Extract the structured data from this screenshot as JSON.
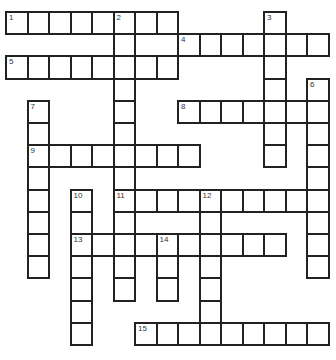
{
  "puzzle": {
    "type": "crossword",
    "origin": {
      "x": 6,
      "y": 12
    },
    "cell_w": 21.5,
    "cell_h": 22.2,
    "cols": 15,
    "rows": 15,
    "border_color": "#222222",
    "cell_fill": "#ffffff"
  },
  "words": [
    {
      "number": "1",
      "direction": "across",
      "row": 0,
      "col": 0,
      "length": 8
    },
    {
      "number": "2",
      "direction": "down",
      "row": 0,
      "col": 5,
      "length": 13
    },
    {
      "number": "3",
      "direction": "down",
      "row": 0,
      "col": 12,
      "length": 7
    },
    {
      "number": "4",
      "direction": "across",
      "row": 1,
      "col": 8,
      "length": 7
    },
    {
      "number": "5",
      "direction": "across",
      "row": 2,
      "col": 0,
      "length": 8
    },
    {
      "number": "6",
      "direction": "down",
      "row": 3,
      "col": 14,
      "length": 9
    },
    {
      "number": "7",
      "direction": "down",
      "row": 4,
      "col": 1,
      "length": 8
    },
    {
      "number": "8",
      "direction": "across",
      "row": 4,
      "col": 8,
      "length": 7
    },
    {
      "number": "9",
      "direction": "across",
      "row": 6,
      "col": 1,
      "length": 8
    },
    {
      "number": "10",
      "direction": "down",
      "row": 8,
      "col": 3,
      "length": 7
    },
    {
      "number": "11",
      "direction": "across",
      "row": 8,
      "col": 5,
      "length": 10
    },
    {
      "number": "12",
      "direction": "down",
      "row": 8,
      "col": 9,
      "length": 7
    },
    {
      "number": "13",
      "direction": "across",
      "row": 10,
      "col": 3,
      "length": 10
    },
    {
      "number": "14",
      "direction": "down",
      "row": 10,
      "col": 7,
      "length": 3
    },
    {
      "number": "15",
      "direction": "across",
      "row": 14,
      "col": 6,
      "length": 9
    }
  ]
}
